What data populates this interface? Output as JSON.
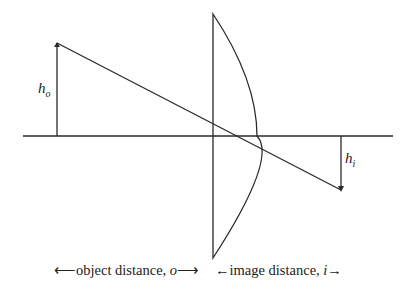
{
  "diagram": {
    "stroke_color": "#2a2a2a",
    "object_height_label": {
      "main": "h",
      "sub": "o"
    },
    "image_height_label": {
      "main": "h",
      "sub": "i"
    },
    "caption_left": "⟵object distance, ",
    "caption_left_var": "o",
    "caption_left_end": "⟶",
    "caption_right_start": "←image distance, ",
    "caption_right_var": "i",
    "caption_right_end": "→"
  }
}
